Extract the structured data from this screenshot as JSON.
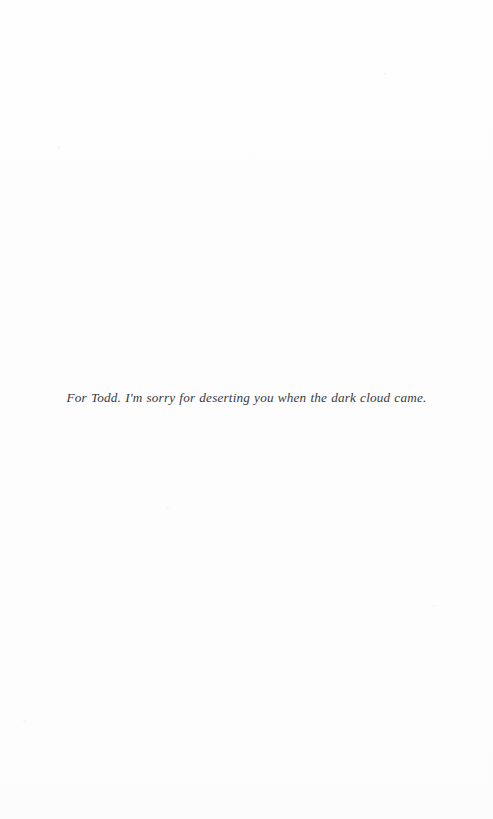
{
  "page": {
    "kind": "book-dedication-page",
    "background_color": "#fdfdfd",
    "ink_color": "#3a3a3e"
  },
  "dedication": {
    "text": "For Todd. I'm sorry for deserting you when the dark cloud came."
  }
}
